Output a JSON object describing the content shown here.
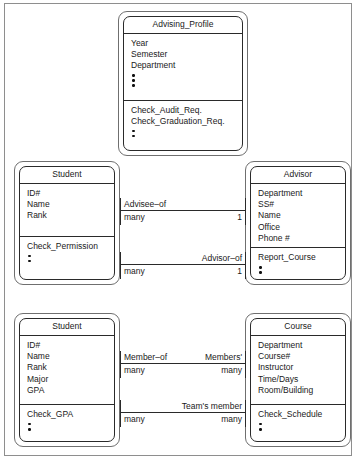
{
  "diagram": {
    "type": "uml-class-diagram",
    "classes": [
      {
        "id": "advising-profile",
        "name": "Advising_Profile",
        "attributes": [
          "Year",
          "Semester",
          "Department"
        ],
        "attribute_dots": 3,
        "operations": [
          "Check_Audit_Req.",
          "Check_Graduation_Req."
        ],
        "operation_dots": 2
      },
      {
        "id": "student-upper",
        "name": "Student",
        "attributes": [
          "ID#",
          "Name",
          "Rank"
        ],
        "attribute_dots": 0,
        "operations": [
          "Check_Permission"
        ],
        "operation_dots": 2
      },
      {
        "id": "advisor",
        "name": "Advisor",
        "attributes": [
          "Department",
          "SS#",
          "Name",
          "Office",
          "Phone #"
        ],
        "attribute_dots": 0,
        "operations": [
          "Report_Course"
        ],
        "operation_dots": 2
      },
      {
        "id": "student-lower",
        "name": "Student",
        "attributes": [
          "ID#",
          "Name",
          "Rank",
          "Major",
          "GPA"
        ],
        "attribute_dots": 0,
        "operations": [
          "Check_GPA"
        ],
        "operation_dots": 2
      },
      {
        "id": "course",
        "name": "Course",
        "attributes": [
          "Department",
          "Course#",
          "Instructor",
          "Time/Days",
          "Room/Building"
        ],
        "attribute_dots": 0,
        "operations": [
          "Check_Schedule"
        ],
        "operation_dots": 2
      }
    ],
    "relationships": [
      {
        "id": "advisee-of",
        "from": "student-upper",
        "to": "advisor",
        "label_left": "Advisee–of",
        "label_right": "",
        "mult_left": "many",
        "mult_right": "1"
      },
      {
        "id": "advisor-of",
        "from": "student-upper",
        "to": "advisor",
        "label_left": "",
        "label_right": "Advisor–of",
        "mult_left": "many",
        "mult_right": "1"
      },
      {
        "id": "member-of",
        "from": "student-lower",
        "to": "course",
        "label_left": "Member–of",
        "label_right": "Members'",
        "mult_left": "many",
        "mult_right": "many"
      },
      {
        "id": "teams-member",
        "from": "student-lower",
        "to": "course",
        "label_left": "",
        "label_right": "Team's member",
        "mult_left": "many",
        "mult_right": "many"
      }
    ]
  }
}
